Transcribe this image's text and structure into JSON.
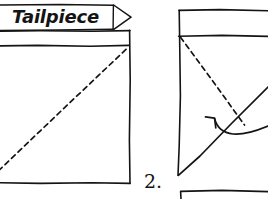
{
  "figure": {
    "ink_color": "#141414",
    "background_color": "#ffffff",
    "style": "hand-drawn line illustration"
  },
  "callout": {
    "label": "Tailpiece",
    "shape": "banner-with-right-arrowhead",
    "box": {
      "x": 2,
      "y": 4,
      "width": 112,
      "height": 26
    },
    "arrow_tip": {
      "x": 131,
      "y": 17
    }
  },
  "panel_left": {
    "name": "figure-1-panel",
    "outline": {
      "x": -12,
      "y": 30,
      "width": 142,
      "height": 153
    },
    "band": {
      "y_top": 30,
      "y_bottom": 45,
      "description": "narrow horizontal strip across top of sheet"
    },
    "dashed_diagonal": {
      "from": {
        "x": -6,
        "y": 176
      },
      "to": {
        "x": 128,
        "y": 47
      },
      "dash_pattern": "5 4"
    }
  },
  "panel_right": {
    "name": "figure-2-panel",
    "step_number": "2.",
    "step_number_position": {
      "x": 146,
      "y": 183
    },
    "top_band": {
      "x": 178,
      "y": 10,
      "width": 92,
      "height": 26
    },
    "left_edge": {
      "from": {
        "x": 179,
        "y": 36
      },
      "to": {
        "x": 178,
        "y": 174
      }
    },
    "dashed_fold": {
      "from": {
        "x": 180,
        "y": 37
      },
      "to": {
        "x": 243,
        "y": 124
      },
      "dash_pattern": "5 4"
    },
    "solid_fold": {
      "from": {
        "x": 178,
        "y": 175
      },
      "to": {
        "x": 268,
        "y": 88
      }
    },
    "curved_arrow": {
      "description": "curved arrow sweeping from right, looping left with arrowhead",
      "arrowhead_at": {
        "x": 214,
        "y": 117
      }
    }
  },
  "panel_bottom": {
    "name": "figure-3-partial",
    "description": "top edge of next figure, cropped at bottom of image",
    "rect": {
      "x": 180,
      "y": 190,
      "width": 88,
      "height": 9
    }
  }
}
